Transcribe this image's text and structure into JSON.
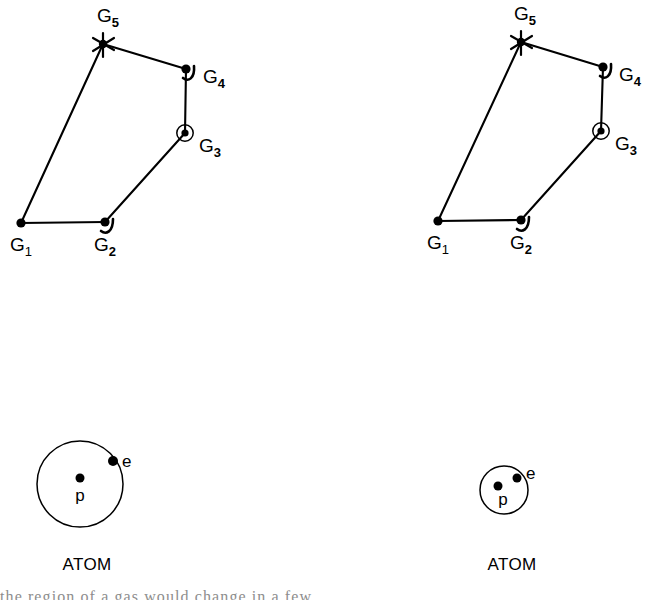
{
  "figure": {
    "background_color": "#ffffff",
    "ink_color": "#000000",
    "width": 650,
    "height": 600
  },
  "graphs": [
    {
      "id": "graph-left",
      "nodes": [
        {
          "id": "G1",
          "base": "G",
          "subscript": "1",
          "x": 21,
          "y": 223,
          "marker": "filled-dot",
          "label_x": 10,
          "label_y": 251
        },
        {
          "id": "G2",
          "base": "G",
          "subscript": "2",
          "x": 105,
          "y": 222,
          "marker": "dot-with-hook",
          "label_x": 94,
          "label_y": 251
        },
        {
          "id": "G3",
          "base": "G",
          "subscript": "3",
          "x": 185,
          "y": 133,
          "marker": "circled-dot",
          "label_x": 199,
          "label_y": 152
        },
        {
          "id": "G4",
          "base": "G",
          "subscript": "4",
          "x": 186,
          "y": 69,
          "marker": "dot-with-hook",
          "label_x": 203,
          "label_y": 83
        },
        {
          "id": "G5",
          "base": "G",
          "subscript": "5",
          "x": 103,
          "y": 44,
          "marker": "star",
          "label_x": 97,
          "label_y": 22
        }
      ],
      "edges": [
        {
          "from": "G1",
          "to": "G2"
        },
        {
          "from": "G2",
          "to": "G3"
        },
        {
          "from": "G3",
          "to": "G4"
        },
        {
          "from": "G4",
          "to": "G5"
        },
        {
          "from": "G5",
          "to": "G1"
        }
      ]
    },
    {
      "id": "graph-right",
      "nodes": [
        {
          "id": "G1",
          "base": "G",
          "subscript": "1",
          "x": 438,
          "y": 221,
          "marker": "filled-dot",
          "label_x": 427,
          "label_y": 249
        },
        {
          "id": "G2",
          "base": "G",
          "subscript": "2",
          "x": 521,
          "y": 220,
          "marker": "dot-with-hook",
          "label_x": 510,
          "label_y": 249
        },
        {
          "id": "G3",
          "base": "G",
          "subscript": "3",
          "x": 601,
          "y": 131,
          "marker": "circled-dot",
          "label_x": 615,
          "label_y": 150
        },
        {
          "id": "G4",
          "base": "G",
          "subscript": "4",
          "x": 603,
          "y": 67,
          "marker": "dot-with-hook",
          "label_x": 619,
          "label_y": 81
        },
        {
          "id": "G5",
          "base": "G",
          "subscript": "5",
          "x": 521,
          "y": 42,
          "marker": "star",
          "label_x": 514,
          "label_y": 20
        }
      ],
      "edges": [
        {
          "from": "G1",
          "to": "G2"
        },
        {
          "from": "G2",
          "to": "G3"
        },
        {
          "from": "G3",
          "to": "G4"
        },
        {
          "from": "G4",
          "to": "G5"
        },
        {
          "from": "G5",
          "to": "G1"
        }
      ]
    }
  ],
  "atoms": [
    {
      "id": "atom-left",
      "caption": "ATOM",
      "caption_x": 87,
      "caption_y": 570,
      "orbit": {
        "cx": 80,
        "cy": 484,
        "r": 43
      },
      "nucleus": {
        "cx": 80,
        "cy": 478,
        "r": 4.5,
        "label": "p",
        "label_x": 80,
        "label_y": 501
      },
      "electron": {
        "cx": 113,
        "cy": 461,
        "r": 5.0,
        "label": "e",
        "label_x": 122,
        "label_y": 467
      }
    },
    {
      "id": "atom-right",
      "caption": "ATOM",
      "caption_x": 512,
      "caption_y": 570,
      "orbit": {
        "cx": 504,
        "cy": 490,
        "r": 24
      },
      "nucleus": {
        "cx": 498,
        "cy": 486,
        "r": 4.5,
        "label": "p",
        "label_x": 503,
        "label_y": 505
      },
      "electron": {
        "cx": 517,
        "cy": 478,
        "r": 4.5,
        "label": "e",
        "label_x": 526,
        "label_y": 479
      }
    }
  ],
  "bottom_text": {
    "clipped_line": "the region of a gas would change in a few"
  }
}
